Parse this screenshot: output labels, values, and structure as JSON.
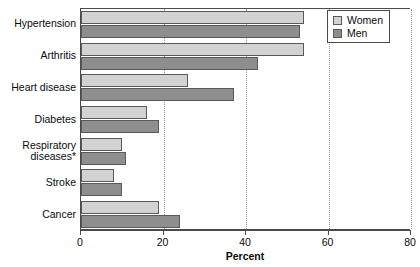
{
  "chart_data": {
    "type": "bar",
    "orientation": "horizontal",
    "title": "",
    "xlabel": "Percent",
    "ylabel": "",
    "xlim": [
      0,
      80
    ],
    "xticks": [
      0,
      20,
      40,
      60,
      80
    ],
    "grid": "vertical-dotted",
    "legend_position": "top-right",
    "categories": [
      "Hypertension",
      "Arthritis",
      "Heart disease",
      "Diabetes",
      "Respiratory diseases*",
      "Stroke",
      "Cancer"
    ],
    "series": [
      {
        "name": "Women",
        "color": "#d2d2d2",
        "values": [
          54,
          54,
          26,
          16,
          10,
          8,
          19
        ]
      },
      {
        "name": "Men",
        "color": "#8e8e8e",
        "values": [
          53,
          43,
          37,
          19,
          11,
          10,
          24
        ]
      }
    ]
  },
  "axis": {
    "tick_labels": [
      "0",
      "20",
      "40",
      "60",
      "80"
    ],
    "title": "Percent"
  },
  "category_labels": [
    {
      "lines": [
        "Hypertension"
      ]
    },
    {
      "lines": [
        "Arthritis"
      ]
    },
    {
      "lines": [
        "Heart disease"
      ]
    },
    {
      "lines": [
        "Diabetes"
      ]
    },
    {
      "lines": [
        "Respiratory",
        "diseases*"
      ]
    },
    {
      "lines": [
        "Stroke"
      ]
    },
    {
      "lines": [
        "Cancer"
      ]
    }
  ],
  "legend": {
    "items": [
      {
        "label": "Women",
        "color": "#d2d2d2"
      },
      {
        "label": "Men",
        "color": "#8e8e8e"
      }
    ]
  }
}
